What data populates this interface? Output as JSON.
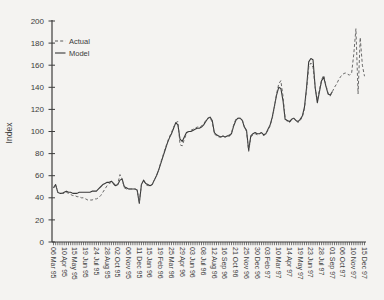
{
  "figure": {
    "background": "#f4f3f1",
    "axis_color": "#3c3c3c",
    "actual_color": "#5a5a5a",
    "model_color": "#383838"
  },
  "chart_data": {
    "type": "line",
    "title": "",
    "xlabel": "",
    "ylabel": "Index",
    "ylim": [
      0,
      200
    ],
    "yticks": [
      0,
      20,
      40,
      60,
      80,
      100,
      120,
      140,
      160,
      180,
      200
    ],
    "grid": false,
    "legend_position": "top-left-inside",
    "n_points": 146,
    "x_label_every": 5,
    "x_tick_labels": [
      "06 Mar 95",
      "10 Apr 95",
      "15 May 95",
      "19 Jun 95",
      "24 Jul 95",
      "28 Aug 95",
      "02 Oct 95",
      "06 Nov 95",
      "11 Dec 95",
      "15 Jan 96",
      "19 Feb 96",
      "25 Mar 96",
      "29 Apr 96",
      "03 Jun 96",
      "08 Jul 96",
      "12 Aug 96",
      "16 Sep 96",
      "21 Oct 96",
      "25 Nov 96",
      "30 Dec 96",
      "03 Feb 97",
      "10 Mar 97",
      "14 Apr 97",
      "19 May 97",
      "23 Jun 97",
      "28 Jul 97",
      "01 Sep 97",
      "06 Oct 97",
      "10 Nov 97",
      "15 Dec 97"
    ],
    "series": [
      {
        "name": "Actual",
        "style": "dashed",
        "values": [
          49,
          52,
          45,
          44,
          44,
          44,
          45,
          44,
          43,
          42,
          42,
          41,
          41,
          40,
          40,
          39,
          38,
          38,
          38,
          39,
          39,
          40,
          42,
          45,
          48,
          51,
          53,
          54,
          52,
          50,
          53,
          61,
          57,
          49,
          48,
          48,
          48,
          48,
          48,
          47,
          36,
          52,
          55,
          52,
          51,
          51,
          52,
          56,
          60,
          65,
          72,
          78,
          84,
          90,
          95,
          99,
          104,
          108,
          109,
          88,
          87,
          93,
          98,
          100,
          101,
          102,
          103,
          104,
          104,
          105,
          107,
          110,
          112,
          113,
          108,
          98,
          96,
          95,
          95,
          96,
          95,
          96,
          97,
          99,
          106,
          111,
          112,
          112,
          111,
          104,
          100,
          82,
          95,
          97,
          98,
          97,
          98,
          99,
          96,
          98,
          101,
          105,
          112,
          122,
          134,
          143,
          146,
          132,
          112,
          109,
          108,
          110,
          112,
          110,
          108,
          110,
          113,
          120,
          138,
          158,
          162,
          158,
          140,
          128,
          138,
          147,
          151,
          142,
          135,
          132,
          136,
          140,
          143,
          147,
          150,
          152,
          153,
          152,
          151,
          153,
          170,
          193,
          134,
          185,
          160,
          150
        ]
      },
      {
        "name": "Model",
        "style": "solid",
        "values": [
          49,
          52,
          45,
          44,
          44,
          45,
          46,
          45,
          45,
          44,
          44,
          44,
          45,
          45,
          45,
          45,
          45,
          45,
          46,
          46,
          46,
          48,
          50,
          52,
          53,
          54,
          54,
          55,
          53,
          51,
          52,
          56,
          57,
          50,
          49,
          48,
          48,
          48,
          48,
          47,
          35,
          52,
          56,
          53,
          52,
          51,
          52,
          56,
          60,
          65,
          71,
          77,
          83,
          89,
          94,
          98,
          103,
          108,
          106,
          93,
          91,
          95,
          99,
          100,
          100,
          101,
          102,
          103,
          103,
          104,
          106,
          109,
          112,
          113,
          110,
          99,
          97,
          96,
          95,
          96,
          95,
          96,
          96,
          98,
          105,
          110,
          112,
          112,
          110,
          104,
          101,
          83,
          96,
          98,
          99,
          98,
          98,
          99,
          97,
          98,
          102,
          106,
          113,
          123,
          133,
          140,
          139,
          128,
          111,
          110,
          109,
          111,
          112,
          110,
          109,
          111,
          114,
          122,
          140,
          163,
          166,
          165,
          140,
          126,
          136,
          146,
          149,
          141,
          134,
          133,
          136
        ]
      }
    ]
  }
}
